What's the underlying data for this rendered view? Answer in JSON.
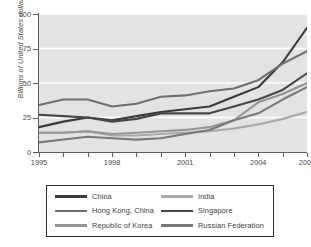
{
  "chart_data": {
    "type": "line",
    "title": "",
    "xlabel": "",
    "ylabel": "Billions of United States dollars",
    "xlim": [
      1995,
      2006
    ],
    "ylim": [
      0,
      100
    ],
    "grid": true,
    "legend_position": "bottom",
    "x": [
      1995,
      1996,
      1997,
      1998,
      1999,
      2000,
      2001,
      2002,
      2003,
      2004,
      2005,
      2006
    ],
    "xtick_labels": [
      "1995",
      "1998",
      "2001",
      "2004",
      "2006"
    ],
    "xtick_values": [
      1995,
      1998,
      2001,
      2004,
      2006
    ],
    "ytick_labels": [
      "0",
      "25",
      "50",
      "75",
      "100"
    ],
    "ytick_values": [
      0,
      25,
      50,
      75,
      100
    ],
    "series": [
      {
        "name": "China",
        "color": "#3a3a3a",
        "values": [
          18,
          22,
          25,
          23,
          26,
          29,
          31,
          33,
          40,
          47,
          65,
          90
        ]
      },
      {
        "name": "India",
        "color": "#a8a8a8",
        "values": [
          14,
          14,
          15,
          12,
          12,
          13,
          14,
          15,
          17,
          20,
          24,
          29
        ]
      },
      {
        "name": "Hong Kong, China",
        "color": "#6e6e6e",
        "values": [
          34,
          38,
          38,
          33,
          35,
          40,
          41,
          44,
          46,
          52,
          64,
          73
        ]
      },
      {
        "name": "Singapore",
        "color": "#474747",
        "values": [
          27,
          26,
          25,
          22,
          24,
          28,
          28,
          28,
          33,
          38,
          45,
          57
        ]
      },
      {
        "name": "Republic of Korea",
        "color": "#959595",
        "values": [
          14,
          14,
          15,
          13,
          14,
          15,
          16,
          18,
          23,
          36,
          42,
          50
        ]
      },
      {
        "name": "Russian Federation",
        "color": "#787878",
        "values": [
          7,
          9,
          11,
          10,
          9,
          10,
          13,
          16,
          23,
          28,
          38,
          47
        ]
      }
    ]
  },
  "axes": {
    "y_label": "Billions of United States dollars"
  },
  "legend": {
    "items": [
      {
        "label": "China",
        "color": "#3a3a3a"
      },
      {
        "label": "India",
        "color": "#a8a8a8"
      },
      {
        "label": "Hong Kong, China",
        "color": "#6e6e6e"
      },
      {
        "label": "Singapore",
        "color": "#474747"
      },
      {
        "label": "Republic of Korea",
        "color": "#959595"
      },
      {
        "label": "Russian Federation",
        "color": "#787878"
      }
    ]
  }
}
